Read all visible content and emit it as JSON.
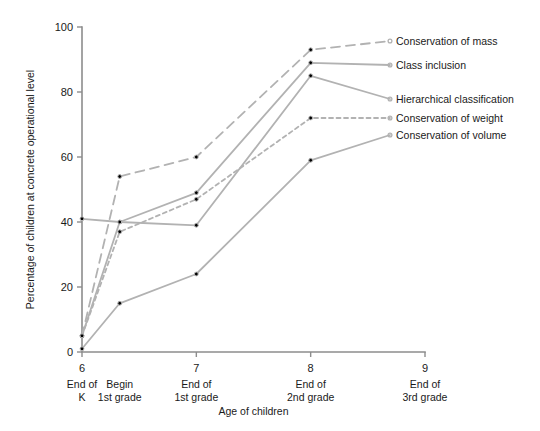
{
  "chart_data": {
    "type": "line",
    "title": "",
    "xlabel": "Age of children",
    "ylabel": "Percentage of children at concrete operational level",
    "xlim": [
      6,
      9
    ],
    "ylim": [
      0,
      100
    ],
    "grid": false,
    "legend_position": "right-inline-labels",
    "y_ticks": [
      "0",
      "20",
      "40",
      "60",
      "80",
      "100"
    ],
    "y_tick_values": [
      0,
      20,
      40,
      60,
      80,
      100
    ],
    "x_ticks": [
      "6",
      "7",
      "8",
      "9"
    ],
    "x_tick_values": [
      6,
      7,
      8,
      9
    ],
    "x_categories": [
      {
        "tick": "6",
        "line1": "End of",
        "line2": "K",
        "x": 6.0
      },
      {
        "tick": "",
        "line1": "Begin",
        "line2": "1st grade",
        "x": 6.33
      },
      {
        "tick": "7",
        "line1": "End of",
        "line2": "1st grade",
        "x": 7.0
      },
      {
        "tick": "8",
        "line1": "End of",
        "line2": "2nd grade",
        "x": 8.0
      },
      {
        "tick": "9",
        "line1": "End of",
        "line2": "3rd grade",
        "x": 9.0
      }
    ],
    "x_points": [
      6.0,
      6.33,
      7.0,
      8.0
    ],
    "series": [
      {
        "name": "Conservation of mass",
        "style": "longdash",
        "color": "#b2b2b2",
        "values": [
          5,
          54,
          60,
          93
        ],
        "label_y": 45
      },
      {
        "name": "Class inclusion",
        "style": "solid",
        "color": "#b2b2b2",
        "values": [
          5,
          40,
          49,
          89
        ],
        "label_y": 69
      },
      {
        "name": "Hierarchical classification",
        "style": "solid",
        "color": "#b2b2b2",
        "values": [
          41,
          40,
          39,
          85
        ],
        "label_y": 103
      },
      {
        "name": "Conservation of weight",
        "style": "shortdash",
        "color": "#b2b2b2",
        "values": [
          5,
          37,
          47,
          72
        ],
        "label_y": 122
      },
      {
        "name": "Conservation of volume",
        "style": "solid",
        "color": "#b2b2b2",
        "values": [
          1,
          15,
          24,
          59
        ],
        "label_y": 139
      }
    ]
  },
  "legend": {
    "items": [
      {
        "label": "Conservation of mass"
      },
      {
        "label": "Class inclusion"
      },
      {
        "label": "Hierarchical classification"
      },
      {
        "label": "Conservation of weight"
      },
      {
        "label": "Conservation of volume"
      }
    ]
  },
  "axes": {
    "y_title": "Percentage of children at concrete operational level",
    "x_title": "Age of children"
  }
}
